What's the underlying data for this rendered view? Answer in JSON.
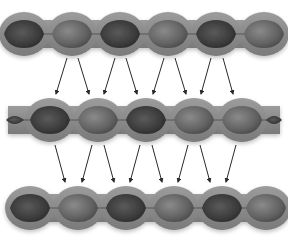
{
  "diagram": {
    "type": "bead-strand-replication",
    "colors": {
      "background": "#ffffff",
      "outer_sheath": "#8c8c8c",
      "outer_sheath_edge": "#6e6e6e",
      "bead_dark": "#3a3a3a",
      "bead_mid": "#6a6a6a",
      "bead_light": "#8a8a8a",
      "arrow": "#2a2a2a"
    },
    "strands": [
      {
        "name": "strand-top",
        "y": 34,
        "x_start": 12,
        "x_end": 278,
        "beads": [
          {
            "cx": 24,
            "shade": "dark",
            "half": "left-cap"
          },
          {
            "cx": 72,
            "shade": "mid"
          },
          {
            "cx": 120,
            "shade": "dark"
          },
          {
            "cx": 168,
            "shade": "mid"
          },
          {
            "cx": 216,
            "shade": "dark"
          },
          {
            "cx": 264,
            "shade": "mid",
            "half": "right-cut"
          }
        ]
      },
      {
        "name": "strand-middle",
        "y": 120,
        "x_start": 8,
        "x_end": 280,
        "beads": [
          {
            "cx": 14,
            "shade": "dark",
            "half": "fish-tail-left"
          },
          {
            "cx": 50,
            "shade": "dark"
          },
          {
            "cx": 98,
            "shade": "mid"
          },
          {
            "cx": 146,
            "shade": "dark"
          },
          {
            "cx": 194,
            "shade": "mid"
          },
          {
            "cx": 242,
            "shade": "mid"
          },
          {
            "cx": 276,
            "shade": "dark",
            "half": "fish-tail-right"
          }
        ]
      },
      {
        "name": "strand-bottom",
        "y": 208,
        "x_start": 14,
        "x_end": 278,
        "beads": [
          {
            "cx": 30,
            "shade": "dark",
            "half": "left-cap"
          },
          {
            "cx": 78,
            "shade": "mid"
          },
          {
            "cx": 126,
            "shade": "dark"
          },
          {
            "cx": 174,
            "shade": "mid"
          },
          {
            "cx": 222,
            "shade": "dark"
          },
          {
            "cx": 266,
            "shade": "mid",
            "half": "right-cut"
          }
        ]
      }
    ],
    "arrow_sets": [
      {
        "name": "arrows-top-to-middle",
        "arrows": [
          {
            "x1": 67,
            "y1": 58,
            "x2": 56,
            "y2": 94
          },
          {
            "x1": 78,
            "y1": 58,
            "x2": 89,
            "y2": 94
          },
          {
            "x1": 115,
            "y1": 58,
            "x2": 104,
            "y2": 94
          },
          {
            "x1": 126,
            "y1": 58,
            "x2": 137,
            "y2": 94
          },
          {
            "x1": 164,
            "y1": 58,
            "x2": 153,
            "y2": 94
          },
          {
            "x1": 175,
            "y1": 58,
            "x2": 186,
            "y2": 94
          },
          {
            "x1": 211,
            "y1": 58,
            "x2": 201,
            "y2": 94
          },
          {
            "x1": 223,
            "y1": 58,
            "x2": 233,
            "y2": 94
          }
        ]
      },
      {
        "name": "arrows-middle-to-bottom",
        "arrows": [
          {
            "x1": 55,
            "y1": 145,
            "x2": 65,
            "y2": 182
          },
          {
            "x1": 92,
            "y1": 145,
            "x2": 82,
            "y2": 182
          },
          {
            "x1": 104,
            "y1": 145,
            "x2": 114,
            "y2": 182
          },
          {
            "x1": 140,
            "y1": 145,
            "x2": 130,
            "y2": 182
          },
          {
            "x1": 152,
            "y1": 145,
            "x2": 162,
            "y2": 182
          },
          {
            "x1": 188,
            "y1": 145,
            "x2": 178,
            "y2": 182
          },
          {
            "x1": 200,
            "y1": 145,
            "x2": 210,
            "y2": 182
          },
          {
            "x1": 236,
            "y1": 145,
            "x2": 226,
            "y2": 182
          }
        ]
      }
    ]
  }
}
